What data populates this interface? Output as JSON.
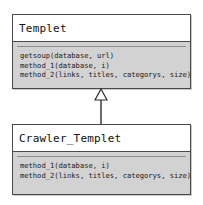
{
  "diagram": {
    "type": "uml-class-diagram",
    "background_color": "#ffffff",
    "border_color": "#4a4a4a",
    "operations_fill_color": "#d2d2d2",
    "name_fill_color": "#ffffff",
    "classes": [
      {
        "id": "templet",
        "name": "Templet",
        "role": "parent",
        "attributes": [],
        "operations": [
          "getsoup(database, url)",
          "method_1(database, i)",
          "method_2(links, titles, categorys, size)"
        ]
      },
      {
        "id": "crawler_templet",
        "name": "Crawler_Templet",
        "role": "child",
        "attributes": [],
        "operations": [
          "method_1(database, i)",
          "method_2(links, titles, categorys, size)"
        ]
      }
    ],
    "relationships": [
      {
        "kind": "generalization",
        "label": "",
        "from": "Crawler_Templet",
        "to": "Templet",
        "arrow": "hollow-triangle",
        "line": "solid"
      }
    ]
  }
}
